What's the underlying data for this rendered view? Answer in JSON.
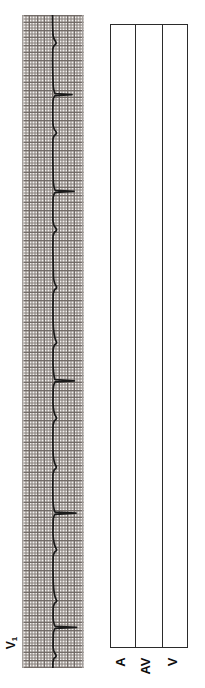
{
  "figure": {
    "name": "electrocardiogram-with-ladder-diagram",
    "orientation": "rotated-90-ccw",
    "background_color": "#ffffff",
    "ink_color": "#1a1a1a"
  },
  "ecg": {
    "lead_label": "V",
    "lead_subscript": "1",
    "lead_label_full": "V1",
    "paper_color": "#f4f2f0",
    "grid_line_color": "#5a524e",
    "trace_color": "#1a1a1a",
    "strip": {
      "left": 22,
      "top": 15,
      "width": 62,
      "height": 653
    },
    "grid": {
      "small_box_px": 1.5,
      "large_box_px": 7.5,
      "small_boxes_per_large": 5
    },
    "beats": [
      {
        "index": 1,
        "qrs_center_y": 28,
        "amplitude": 9,
        "type": "qrs"
      },
      {
        "index": 2,
        "qrs_center_y": 80,
        "amplitude": 20,
        "type": "qrs"
      },
      {
        "index": 3,
        "qrs_center_y": 118,
        "amplitude": 10,
        "type": "qrs"
      },
      {
        "index": 4,
        "qrs_center_y": 176,
        "amplitude": 22,
        "type": "qrs"
      },
      {
        "index": 5,
        "qrs_center_y": 213,
        "amplitude": 10,
        "type": "qrs"
      },
      {
        "index": 6,
        "qrs_center_y": 272,
        "amplitude": 9,
        "type": "qrs"
      },
      {
        "index": 7,
        "qrs_center_y": 327,
        "amplitude": 11,
        "type": "qrs"
      },
      {
        "index": 8,
        "qrs_center_y": 366,
        "amplitude": 22,
        "type": "qrs"
      },
      {
        "index": 9,
        "qrs_center_y": 403,
        "amplitude": 10,
        "type": "qrs"
      },
      {
        "index": 10,
        "qrs_center_y": 452,
        "amplitude": 9,
        "type": "qrs"
      },
      {
        "index": 11,
        "qrs_center_y": 498,
        "amplitude": 24,
        "type": "qrs"
      },
      {
        "index": 12,
        "qrs_center_y": 534,
        "amplitude": 11,
        "type": "qrs"
      },
      {
        "index": 13,
        "qrs_center_y": 585,
        "amplitude": 9,
        "type": "qrs"
      },
      {
        "index": 14,
        "qrs_center_y": 612,
        "amplitude": 24,
        "type": "qrs"
      },
      {
        "index": 15,
        "qrs_center_y": 640,
        "amplitude": 8,
        "type": "qrs"
      }
    ],
    "trace_path": "M 30.5 0 L 30.6 10 L 31.0 20 Q 31.6 24 33.5 26.5 Q 35.2 28.6 32.0 30.6 L 30.8 34 L 30.6 46 L 30.8 58 L 31.2 70 Q 31.7 76 33.0 78.5 L 50.0 79.6 L 33.0 80.6 Q 31.4 82 31.0 86 L 30.8 96 L 30.9 108 Q 31.4 114 33.8 116.5 Q 35.6 118.6 32.2 120.4 L 31.0 124 L 30.8 138 L 31.0 152 L 31.3 166 Q 31.8 173 33.2 175.4 L 52.0 176.4 L 33.2 177.5 Q 31.5 179 31.1 184 L 30.9 196 L 31.0 206 Q 31.5 211 33.9 213.4 Q 35.7 215.4 32.3 217.3 L 31.1 221 L 30.9 234 L 31.2 248 L 31.5 262 Q 32.0 268 34.0 270.8 Q 35.8 272.9 32.4 274.8 L 31.2 279 L 31.0 292 L 31.1 306 Q 31.6 321 33.9 325.8 Q 35.8 328 32.4 330 L 31.2 334 L 31.0 348 Q 31.4 360 32.9 364.6 L 52.5 365.8 L 33.0 366.9 Q 31.5 369 31.2 374 L 31.0 388 Q 31.5 398 33.8 401.6 Q 35.7 403.8 32.3 405.8 L 31.1 410 L 30.9 424 L 31.1 438 Q 31.6 447 33.7 450.6 Q 35.5 452.8 32.2 454.8 L 31.0 459 L 30.8 472 L 31.0 486 Q 31.5 494 33.0 497.2 L 54.0 498.2 L 33.0 499.3 Q 31.5 501 31.2 506 L 31.0 518 Q 31.5 529 33.9 533.2 Q 35.8 535.4 32.4 537.3 L 31.2 541 L 31.0 554 L 31.3 568 Q 31.8 580 34.0 584.2 Q 35.9 586.4 32.5 588.3 L 31.3 592 L 31.1 602 Q 31.6 609 33.1 611.4 L 54.5 612.4 L 33.1 613.5 Q 31.6 615 31.3 620 L 31.1 632 Q 31.6 637 33.5 639.4 Q 35.2 641.4 32.0 643.2 L 31.0 647 L 30.9 653"
  },
  "ladder": {
    "title": "ladder-diagram",
    "border_color": "#2b2b2b",
    "background_color": "#ffffff",
    "box": {
      "left": 110,
      "top": 24,
      "width": 78,
      "height": 624
    },
    "tiers": [
      {
        "id": "a",
        "label": "A",
        "description": "atrial"
      },
      {
        "id": "av",
        "label": "AV",
        "description": "atrioventricular-node"
      },
      {
        "id": "v",
        "label": "V",
        "description": "ventricular"
      }
    ],
    "divider_positions": [
      24.5,
      51.5
    ]
  }
}
